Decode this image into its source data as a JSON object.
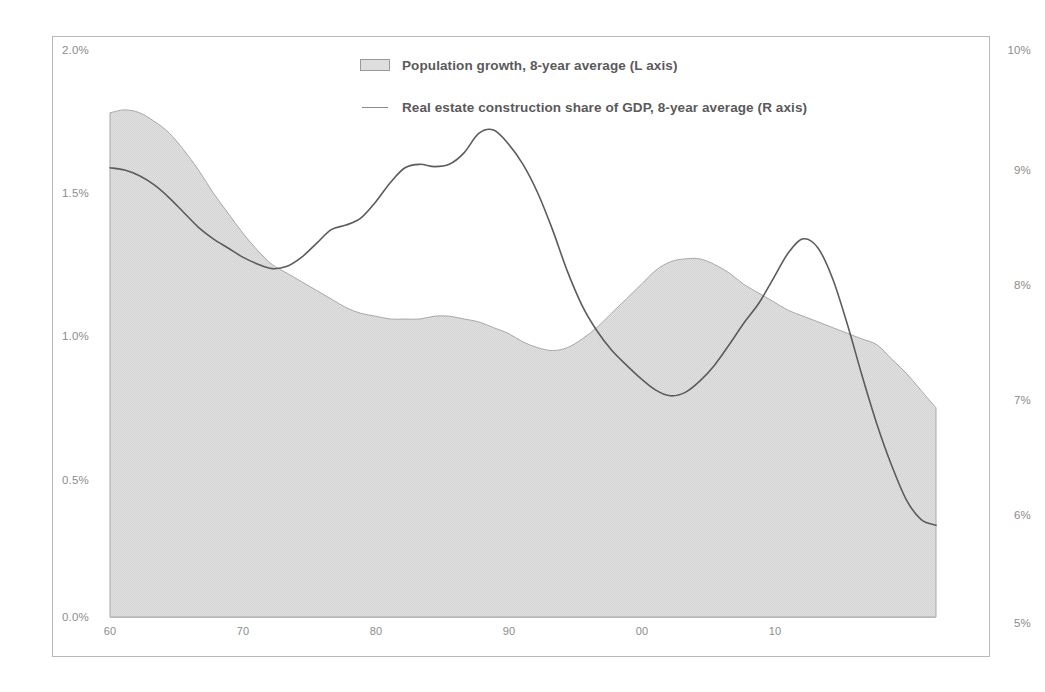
{
  "chart_data": {
    "type": "area",
    "title": "",
    "subtitle": "",
    "xlabel": "",
    "ylabel": "",
    "grid": false,
    "legend_position": "top-center",
    "x_axis": {
      "tick_labels": [
        "60",
        "70",
        "80",
        "90",
        "00",
        "10"
      ],
      "tick_values": [
        1960,
        1970,
        1980,
        1990,
        2000,
        2010
      ],
      "xlim": [
        1960,
        2016
      ]
    },
    "y_axis_left": {
      "label": "Population growth, 8-year average",
      "tick_labels": [
        "0.0%",
        "0.5%",
        "1.0%",
        "1.5%",
        "2.0%"
      ],
      "tick_values": [
        0.0,
        0.5,
        1.0,
        1.5,
        2.0
      ],
      "ylim": [
        0.0,
        2.0
      ],
      "unit": "%"
    },
    "y_axis_right": {
      "label": "Real estate construction share of GDP, 8-year average",
      "tick_labels": [
        "5%",
        "6%",
        "7%",
        "8%",
        "9%",
        "10%"
      ],
      "tick_values": [
        5,
        6,
        7,
        8,
        9,
        10
      ],
      "ylim": [
        5,
        10
      ],
      "unit": "%"
    },
    "series": [
      {
        "name": "Population growth, 8-year average (L axis)",
        "axis": "left",
        "render": "area",
        "fill_color": "#dedede",
        "line_color": "#a8a8a8",
        "x": [
          1960,
          1961,
          1962,
          1963,
          1964,
          1965,
          1966,
          1967,
          1968,
          1969,
          1970,
          1971,
          1972,
          1973,
          1974,
          1975,
          1976,
          1977,
          1978,
          1979,
          1980,
          1981,
          1982,
          1983,
          1984,
          1985,
          1986,
          1987,
          1988,
          1989,
          1990,
          1991,
          1992,
          1993,
          1994,
          1995,
          1996,
          1997,
          1998,
          1999,
          2000,
          2001,
          2002,
          2003,
          2004,
          2005,
          2006,
          2007,
          2008,
          2009,
          2010,
          2011,
          2012,
          2013,
          2014,
          2015,
          2016
        ],
        "values": [
          1.76,
          1.77,
          1.76,
          1.73,
          1.69,
          1.63,
          1.56,
          1.48,
          1.41,
          1.34,
          1.28,
          1.23,
          1.2,
          1.17,
          1.14,
          1.11,
          1.08,
          1.06,
          1.05,
          1.04,
          1.04,
          1.04,
          1.05,
          1.05,
          1.04,
          1.03,
          1.01,
          0.99,
          0.96,
          0.94,
          0.93,
          0.94,
          0.97,
          1.01,
          1.06,
          1.11,
          1.16,
          1.21,
          1.24,
          1.25,
          1.25,
          1.23,
          1.2,
          1.16,
          1.13,
          1.1,
          1.07,
          1.05,
          1.03,
          1.01,
          0.99,
          0.97,
          0.95,
          0.9,
          0.85,
          0.79,
          0.73
        ]
      },
      {
        "name": "Real estate construction share of GDP, 8-year average (R axis)",
        "axis": "right",
        "render": "line",
        "line_color": "#5c5c5c",
        "x": [
          1960,
          1961,
          1962,
          1963,
          1964,
          1965,
          1966,
          1967,
          1968,
          1969,
          1970,
          1971,
          1972,
          1973,
          1974,
          1975,
          1976,
          1977,
          1978,
          1979,
          1980,
          1981,
          1982,
          1983,
          1984,
          1985,
          1986,
          1987,
          1988,
          1989,
          1990,
          1991,
          1992,
          1993,
          1994,
          1995,
          1996,
          1997,
          1998,
          1999,
          2000,
          2001,
          2002,
          2003,
          2004,
          2005,
          2006,
          2007,
          2008,
          2009,
          2010,
          2011,
          2012,
          2013,
          2014,
          2015,
          2016
        ],
        "values": [
          8.92,
          8.9,
          8.85,
          8.77,
          8.66,
          8.53,
          8.4,
          8.3,
          8.22,
          8.14,
          8.08,
          8.04,
          8.06,
          8.14,
          8.26,
          8.38,
          8.42,
          8.48,
          8.62,
          8.79,
          8.92,
          8.95,
          8.93,
          8.95,
          9.05,
          9.22,
          9.25,
          9.13,
          8.95,
          8.7,
          8.38,
          8.02,
          7.72,
          7.5,
          7.33,
          7.2,
          7.08,
          6.98,
          6.93,
          6.96,
          7.06,
          7.2,
          7.38,
          7.57,
          7.74,
          7.96,
          8.18,
          8.3,
          8.22,
          7.95,
          7.55,
          7.1,
          6.68,
          6.32,
          6.02,
          5.85,
          5.8
        ]
      }
    ]
  }
}
